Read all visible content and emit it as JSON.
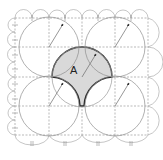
{
  "diagram": {
    "label": "A",
    "colors": {
      "shade": "#d9d9d9",
      "outline": "#2a2a2a",
      "circle": "#8e8e8e",
      "grid": "#8a8a8a",
      "background": "#ffffff"
    },
    "grid": {
      "x": [
        15,
        49,
        82,
        115,
        148
      ],
      "y": [
        18,
        47,
        77,
        106,
        135
      ]
    },
    "circles": [
      {
        "cx": 49,
        "cy": 47,
        "r": 30
      },
      {
        "cx": 115,
        "cy": 47,
        "r": 30
      },
      {
        "cx": 49,
        "cy": 106,
        "r": 30
      },
      {
        "cx": 115,
        "cy": 106,
        "r": 30
      }
    ],
    "shaded_region": "upper semicircle centered at (82,77) r=30 bounded below by two concave arcs of lower circles"
  }
}
